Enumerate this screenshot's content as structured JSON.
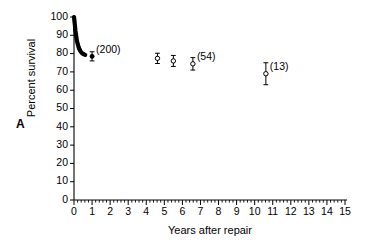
{
  "figure": {
    "panel_label": "A"
  },
  "chart_data": {
    "type": "scatter",
    "title": "",
    "xlabel": "Years after repair",
    "ylabel": "Percent survival",
    "xlim": [
      0,
      15
    ],
    "ylim": [
      0,
      100
    ],
    "xticks": [
      0,
      1,
      2,
      3,
      4,
      5,
      6,
      7,
      8,
      9,
      10,
      11,
      12,
      13,
      14,
      15
    ],
    "xtick_labels": [
      "0",
      "1",
      "2",
      "3",
      "4",
      "5",
      "6",
      "7",
      "8",
      "9",
      "10",
      "11",
      "12",
      "13",
      "14",
      "15"
    ],
    "yticks": [
      0,
      10,
      20,
      30,
      40,
      50,
      60,
      70,
      80,
      90,
      100
    ],
    "ytick_labels": [
      "0",
      "10",
      "20",
      "30",
      "40",
      "50",
      "60",
      "70",
      "80",
      "90",
      "100"
    ],
    "minor_x_ticks_per_interval": 4,
    "grid": false,
    "legend": "none",
    "series": [
      {
        "name": "survival-curve",
        "style": "dense-stepped-curve",
        "x": [
          0.0,
          0.02,
          0.04,
          0.06,
          0.08,
          0.1,
          0.13,
          0.16,
          0.2,
          0.24,
          0.28,
          0.33,
          0.38,
          0.43,
          0.48,
          0.55,
          0.62
        ],
        "y": [
          100.0,
          98.5,
          96.5,
          94.5,
          92.5,
          91.0,
          89.0,
          87.0,
          85.5,
          84.0,
          82.8,
          81.8,
          81.0,
          80.4,
          80.0,
          79.6,
          79.3
        ]
      },
      {
        "name": "annotated-points",
        "style": "open-circle-with-error-bars",
        "points": [
          {
            "x": 1.0,
            "y": 78.5,
            "err_low": 2.5,
            "err_high": 2.5,
            "label": "(200)",
            "marker": "filled"
          },
          {
            "x": 4.62,
            "y": 77.4,
            "err_low": 2.8,
            "err_high": 2.8,
            "label": "",
            "marker": "open"
          },
          {
            "x": 5.5,
            "y": 76.0,
            "err_low": 3.0,
            "err_high": 3.0,
            "label": "",
            "marker": "open"
          },
          {
            "x": 6.58,
            "y": 74.4,
            "err_low": 3.4,
            "err_high": 3.4,
            "label": "(54)",
            "marker": "open"
          },
          {
            "x": 10.62,
            "y": 69.0,
            "err_low": 6.0,
            "err_high": 6.0,
            "label": "(13)",
            "marker": "open"
          }
        ]
      }
    ],
    "annotations": [
      {
        "text": "(200)",
        "x": 1.0,
        "y": 78.5
      },
      {
        "text": "(54)",
        "x": 6.58,
        "y": 74.4
      },
      {
        "text": "(13)",
        "x": 10.62,
        "y": 69.0
      }
    ],
    "colors": {
      "axis": "#000000",
      "marker": "#000000",
      "marker_fill": "#ffffff",
      "background": "#ffffff"
    }
  }
}
